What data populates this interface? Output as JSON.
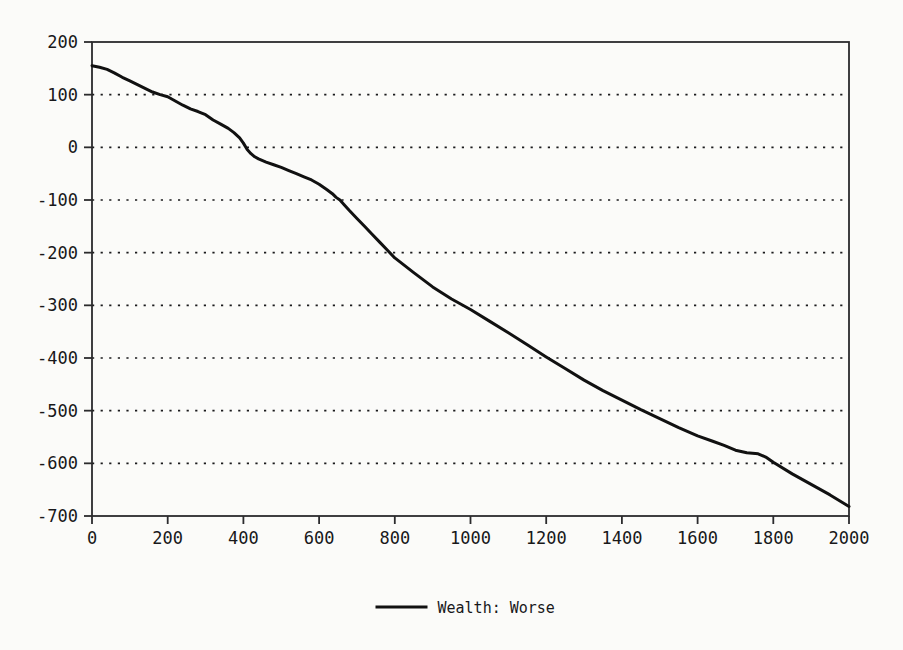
{
  "chart_data": {
    "type": "line",
    "title": "",
    "xlabel": "",
    "ylabel": "",
    "xlim": [
      0,
      2000
    ],
    "ylim": [
      -700,
      200
    ],
    "grid": true,
    "grid_style": "dotted-horizontal",
    "legend_position": "bottom-center",
    "xticks": [
      0,
      200,
      400,
      600,
      800,
      1000,
      1200,
      1400,
      1600,
      1800,
      2000
    ],
    "xtick_labels": [
      "0",
      "200",
      "400",
      "600",
      "800",
      "1000",
      "1200",
      "1400",
      "1600",
      "1800",
      "2000"
    ],
    "yticks": [
      200,
      100,
      0,
      -100,
      -200,
      -300,
      -400,
      -500,
      -600,
      -700
    ],
    "ytick_labels": [
      "200",
      "100",
      "0",
      "-100",
      "-200",
      "-300",
      "-400",
      "-500",
      "-600",
      "-700"
    ],
    "series": [
      {
        "name": "Wealth: Worse",
        "color": "#111111",
        "linewidth": 3,
        "x": [
          0,
          20,
          40,
          60,
          80,
          100,
          120,
          140,
          160,
          180,
          200,
          220,
          240,
          260,
          280,
          300,
          320,
          340,
          360,
          375,
          390,
          400,
          410,
          420,
          430,
          440,
          460,
          480,
          500,
          520,
          540,
          560,
          580,
          600,
          620,
          635,
          645,
          655,
          665,
          680,
          700,
          720,
          740,
          760,
          780,
          800,
          850,
          900,
          950,
          1000,
          1050,
          1100,
          1150,
          1200,
          1250,
          1300,
          1350,
          1400,
          1450,
          1500,
          1550,
          1600,
          1640,
          1670,
          1700,
          1730,
          1760,
          1780,
          1800,
          1850,
          1900,
          1950,
          2000
        ],
        "y": [
          155,
          152,
          148,
          141,
          133,
          126,
          119,
          112,
          105,
          100,
          96,
          88,
          80,
          73,
          68,
          62,
          52,
          44,
          36,
          28,
          18,
          8,
          -4,
          -12,
          -18,
          -22,
          -28,
          -33,
          -38,
          -44,
          -50,
          -56,
          -62,
          -70,
          -80,
          -88,
          -95,
          -100,
          -108,
          -120,
          -135,
          -150,
          -165,
          -180,
          -195,
          -210,
          -238,
          -265,
          -288,
          -308,
          -330,
          -352,
          -375,
          -398,
          -420,
          -442,
          -462,
          -480,
          -498,
          -515,
          -532,
          -548,
          -558,
          -566,
          -575,
          -580,
          -582,
          -588,
          -598,
          -620,
          -640,
          -660,
          -682
        ]
      }
    ]
  },
  "legend": {
    "entries": [
      {
        "label": "Wealth: Worse",
        "color": "#111111"
      }
    ]
  },
  "axes": {
    "frame_color": "#2b2b2d",
    "background": "#fbfbf9"
  }
}
